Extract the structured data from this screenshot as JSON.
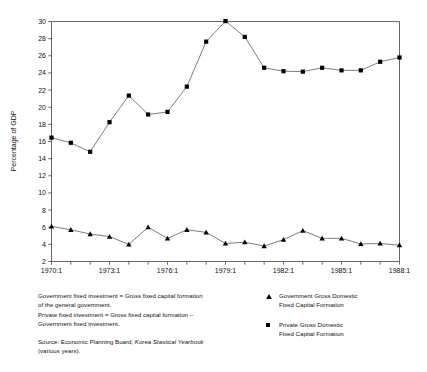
{
  "chart_data": {
    "type": "line",
    "title": "",
    "subtitle": "",
    "xlabel": "",
    "ylabel": "Percentage of GDP",
    "ylim": [
      2,
      30
    ],
    "ytick_step": 2,
    "yticks": [
      2,
      4,
      6,
      8,
      10,
      12,
      14,
      16,
      18,
      20,
      22,
      24,
      26,
      28,
      30
    ],
    "grid": false,
    "legend_position": "below-right",
    "x": [
      "1970:1",
      "1971:1",
      "1972:1",
      "1973:1",
      "1974:1",
      "1975:1",
      "1976:1",
      "1977:1",
      "1978:1",
      "1979:1",
      "1980:1",
      "1981:1",
      "1982:1",
      "1983:1",
      "1984:1",
      "1985:1",
      "1986:1",
      "1987:1",
      "1988:1"
    ],
    "xtick_labels": [
      "1970:1",
      "",
      "",
      "1973:1",
      "",
      "",
      "1976:1",
      "",
      "",
      "1979:1",
      "",
      "",
      "1982:1",
      "",
      "",
      "1985:1",
      "",
      "",
      "1988:1"
    ],
    "xlim_labels": [
      "1970:1",
      "1988:1"
    ],
    "series": [
      {
        "name": "Government Gross Domestic Fixed Capital Formation",
        "marker": "triangle",
        "values": [
          6.1,
          5.7,
          5.2,
          4.9,
          4.0,
          6.0,
          4.7,
          5.7,
          5.4,
          4.1,
          4.25,
          3.8,
          4.55,
          5.6,
          4.7,
          4.7,
          4.05,
          4.1,
          3.9
        ]
      },
      {
        "name": "Private Gross Domestic Fixed Capital Formation",
        "marker": "square",
        "values": [
          16.45,
          15.85,
          14.8,
          18.25,
          21.35,
          19.15,
          19.45,
          22.4,
          27.65,
          30.05,
          28.2,
          24.6,
          24.2,
          24.15,
          24.6,
          24.3,
          24.3,
          25.3,
          25.8
        ]
      }
    ]
  },
  "axis": {
    "y_label": "Percentage of GDP"
  },
  "notes": {
    "line1": "Government fixed investment = Gross fixed capital formation",
    "line2": "of the general government.",
    "line3": "Private fixed investment = Gross fixed capital formation –",
    "line4": "Government fixed investment.",
    "source_prefix": "Source: Economic Planning Board, ",
    "source_italic": "Korea Stastical Yearbook",
    "source_suffix": "(various years)."
  },
  "legend": {
    "items": [
      {
        "marker": "triangle-marker",
        "line1": "Government Gross Domestic",
        "line2": "Fixed Capital Formation"
      },
      {
        "marker": "square-marker",
        "line1": "Private Gross Domestic",
        "line2": "Fixed Capital Formation"
      }
    ]
  },
  "colors": {
    "line": "#666666",
    "marker": "#000000",
    "axis": "#555555",
    "text": "#111111"
  }
}
